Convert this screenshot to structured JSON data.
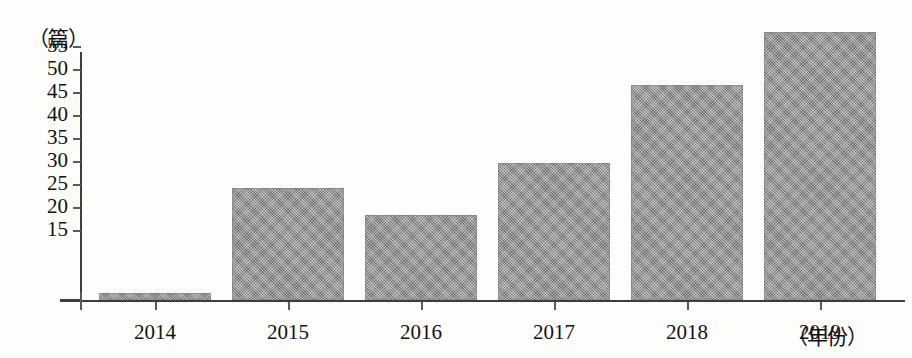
{
  "chart_data": {
    "type": "bar",
    "title": "",
    "subtitle": "",
    "xlabel": "（年份）",
    "ylabel": "（篇）",
    "categories": [
      "2014",
      "2015",
      "2016",
      "2017",
      "2018",
      "2019"
    ],
    "values": [
      1.5,
      24.3,
      18.4,
      29.7,
      46.8,
      58.2
    ],
    "series": [
      {
        "name": "论文数量",
        "values": [
          1.5,
          24.3,
          18.4,
          29.7,
          46.8,
          58.2
        ]
      }
    ],
    "ylim": [
      10,
      60
    ],
    "ytick_labels": [
      "15",
      "20",
      "25",
      "30",
      "35",
      "40",
      "45",
      "50",
      "55"
    ],
    "ytick_values": [
      15,
      20,
      25,
      30,
      35,
      40,
      45,
      50,
      55
    ],
    "grid": false,
    "legend": "none",
    "bar_color": "#8d8d8d",
    "axis_color": "#3d3d3d",
    "background_color": "#fdfdfc"
  },
  "axis": {
    "y_unit": "（篇）",
    "x_unit": "（年份）"
  }
}
